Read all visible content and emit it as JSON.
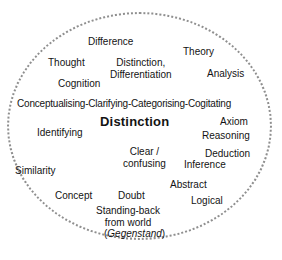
{
  "diagram": {
    "title": "Distinction",
    "shape": "dotted-ellipse",
    "border_color": "#8f8f8f",
    "background_color": "#ffffff",
    "text_color": "#131313",
    "center_term": "Distinction",
    "terms": [
      {
        "label": "Difference",
        "x": 88,
        "y": 36,
        "style": "plain",
        "align": "left"
      },
      {
        "label": "Theory",
        "x": 183,
        "y": 46,
        "style": "plain",
        "align": "left"
      },
      {
        "label": "Thought",
        "x": 48,
        "y": 57,
        "style": "plain",
        "align": "left"
      },
      {
        "label": "Distinction,\nDifferentiation",
        "x": 110,
        "y": 57,
        "style": "multiline",
        "align": "center"
      },
      {
        "label": "Analysis",
        "x": 207,
        "y": 68,
        "style": "plain",
        "align": "left"
      },
      {
        "label": "Cognition",
        "x": 58,
        "y": 78,
        "style": "plain",
        "align": "left"
      },
      {
        "label": "Conceptualising-Clarifying-Categorising-Cogitating",
        "x": 17,
        "y": 98,
        "style": "wide",
        "align": "left"
      },
      {
        "label": "Axiom",
        "x": 220,
        "y": 116,
        "style": "plain",
        "align": "left"
      },
      {
        "label": "Identifying",
        "x": 37,
        "y": 127,
        "style": "plain",
        "align": "left"
      },
      {
        "label": "Reasoning",
        "x": 202,
        "y": 130,
        "style": "plain",
        "align": "left"
      },
      {
        "label": "Clear /\nconfusing",
        "x": 123,
        "y": 146,
        "style": "multiline",
        "align": "center"
      },
      {
        "label": "Deduction",
        "x": 205,
        "y": 148,
        "style": "plain",
        "align": "left"
      },
      {
        "label": "Inference",
        "x": 184,
        "y": 159,
        "style": "plain",
        "align": "left"
      },
      {
        "label": "Similarity",
        "x": 15,
        "y": 165,
        "style": "plain",
        "align": "left"
      },
      {
        "label": "Abstract",
        "x": 170,
        "y": 179,
        "style": "plain",
        "align": "left"
      },
      {
        "label": "Concept",
        "x": 55,
        "y": 190,
        "style": "plain",
        "align": "left"
      },
      {
        "label": "Doubt",
        "x": 118,
        "y": 190,
        "style": "plain",
        "align": "left"
      },
      {
        "label": "Logical",
        "x": 191,
        "y": 195,
        "style": "plain",
        "align": "left"
      },
      {
        "label": "Standing-back\nfrom world",
        "x": 96,
        "y": 205,
        "style": "multiline",
        "align": "center"
      }
    ],
    "center": {
      "label": "Distinction",
      "x": 100,
      "y": 118
    },
    "gegenstand": {
      "prefix": "(",
      "italic": "Gegenstand",
      "suffix": ")",
      "x": 104,
      "y": 228
    }
  }
}
